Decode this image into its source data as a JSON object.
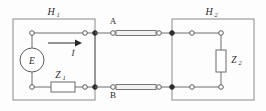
{
  "figure": {
    "background_color": "#fdfdfd",
    "line_color": "#6e6e6e",
    "text_color": "#2b2b2b"
  },
  "labels": {
    "left_block": "H",
    "left_block_sub": "1",
    "right_block": "H",
    "right_block_sub": "2",
    "terminal_a": "A",
    "terminal_b": "B",
    "source": "E",
    "current": "İ",
    "impedance_1": "Z",
    "impedance_1_sub": "1",
    "impedance_2": "Z",
    "impedance_2_sub": "2"
  },
  "components": [
    {
      "name": "voltage-source",
      "symbol": "E",
      "type": "circle-source",
      "location": "left-branch-vertical"
    },
    {
      "name": "impedance-z1",
      "symbol": "Z1",
      "type": "resistor-box-horizontal",
      "location": "left-bottom-branch"
    },
    {
      "name": "impedance-z2",
      "symbol": "Z2",
      "type": "resistor-box-vertical",
      "location": "right-branch-vertical"
    },
    {
      "name": "transmission-line-top",
      "type": "transmission-line",
      "location": "between-A-and-right-block"
    },
    {
      "name": "transmission-line-bottom",
      "type": "transmission-line",
      "location": "between-B-and-right-block"
    }
  ],
  "current_arrow": {
    "direction": "right",
    "label": "İ"
  }
}
